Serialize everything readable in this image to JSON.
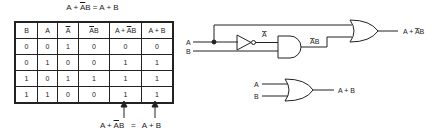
{
  "title": {
    "lhs": "A + ",
    "bar": "A",
    "mid": "B = A + B"
  },
  "table": {
    "headers": [
      {
        "pre": "",
        "bar": "",
        "post": "B"
      },
      {
        "pre": "",
        "bar": "",
        "post": "A"
      },
      {
        "pre": "",
        "bar": "A",
        "post": ""
      },
      {
        "pre": "",
        "bar": "A",
        "post": "B"
      },
      {
        "pre": "A + ",
        "bar": "A",
        "post": "B"
      },
      {
        "pre": "",
        "bar": "",
        "post": "A + B"
      }
    ],
    "rows": [
      [
        "0",
        "0",
        "1",
        "0",
        "0",
        "0"
      ],
      [
        "0",
        "1",
        "0",
        "0",
        "1",
        "1"
      ],
      [
        "1",
        "0",
        "1",
        "1",
        "1",
        "1"
      ],
      [
        "1",
        "1",
        "0",
        "0",
        "1",
        "1"
      ]
    ]
  },
  "footer": {
    "left_pre": "A + ",
    "left_bar": "A",
    "left_post": "B",
    "eq": "=",
    "right": "A + B"
  },
  "circuit1": {
    "input_a": "A",
    "input_b": "B",
    "not_out": "A",
    "and_out_bar": "A",
    "and_out_post": "B",
    "output_pre": "A + ",
    "output_bar": "A",
    "output_post": "B"
  },
  "circuit2": {
    "input_a": "A",
    "input_b": "B",
    "output": "A + B"
  }
}
